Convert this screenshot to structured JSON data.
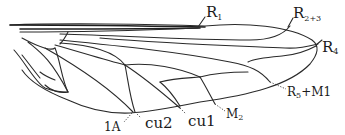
{
  "figure": {
    "line_color": "#2a2a2a",
    "background": "#ffffff"
  },
  "labels": {
    "r1": {
      "main": "R",
      "sub": "1"
    },
    "r2r3": {
      "main": "R",
      "sub": "2+3"
    },
    "r4": {
      "main": "R",
      "sub": "4"
    },
    "r5m1": {
      "main": "R",
      "sub": "5",
      "rest": "+M1"
    },
    "m2": {
      "main": "M",
      "sub": "2"
    },
    "cu1": {
      "text": "cu1"
    },
    "cu2": {
      "text": "cu2"
    },
    "a1": {
      "text": "1A"
    }
  }
}
